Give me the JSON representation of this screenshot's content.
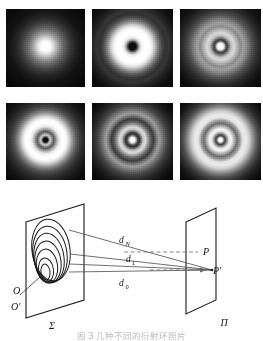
{
  "figure": {
    "kind": "diffraction-ring-photographs-with-optical-schematic",
    "caption": "图 3 几种不同的衍射环照片"
  },
  "panels": {
    "rows": 2,
    "cols": 3,
    "items": [
      {
        "id": "panel-1",
        "position": "top-left",
        "center": "bright-spot",
        "rings": 0
      },
      {
        "id": "panel-2",
        "position": "top-center",
        "center": "dark-spot",
        "rings": 2
      },
      {
        "id": "panel-3",
        "position": "top-right",
        "center": "bright-spot",
        "rings": 3
      },
      {
        "id": "panel-4",
        "position": "bottom-left",
        "center": "dark-spot",
        "rings": 3
      },
      {
        "id": "panel-5",
        "position": "bottom-center",
        "center": "bright-spot",
        "rings": 4
      },
      {
        "id": "panel-6",
        "position": "bottom-right",
        "center": "bright-spot",
        "rings": 4
      }
    ]
  },
  "diagram": {
    "planes": {
      "source_plane_label": "Σ",
      "screen_plane_label": "Π"
    },
    "source_points": {
      "outer_label": "O",
      "inner_label": "O'"
    },
    "image_points": {
      "upper_label": "P",
      "lower_label": "P'"
    },
    "distances": [
      {
        "label": "d",
        "sub": "N"
      },
      {
        "label": "d",
        "sub": "1"
      },
      {
        "label": "d",
        "sub": "0"
      }
    ],
    "zone_count": 6,
    "colors": {
      "stroke": "#1a1a1a",
      "ray": "#4a4a4a",
      "dashed_ray": "#6b6b6b"
    }
  }
}
